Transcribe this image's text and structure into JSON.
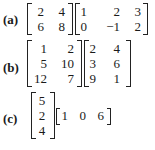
{
  "problems": [
    {
      "label": "(a)",
      "matrices": [
        {
          "rows": [
            [
              "2",
              "4"
            ],
            [
              "6",
              "8"
            ]
          ]
        },
        {
          "rows": [
            [
              "1",
              "2",
              "3"
            ],
            [
              "0",
              "−1",
              "2"
            ]
          ]
        }
      ]
    },
    {
      "label": "(b)",
      "matrices": [
        {
          "rows": [
            [
              "1",
              "2"
            ],
            [
              "5",
              "10"
            ],
            [
              "12",
              "7"
            ]
          ]
        },
        {
          "rows": [
            [
              "2",
              "4"
            ],
            [
              "3",
              "6"
            ],
            [
              "9",
              "1"
            ]
          ]
        }
      ]
    },
    {
      "label": "(c)",
      "matrices": [
        {
          "rows": [
            [
              "5"
            ],
            [
              "2"
            ],
            [
              "4"
            ]
          ]
        },
        {
          "rows": [
            [
              "1",
              "0",
              "6"
            ]
          ]
        }
      ]
    }
  ]
}
